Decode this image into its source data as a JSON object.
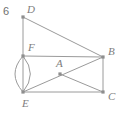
{
  "figure": {
    "number_label": "6",
    "canvas": {
      "width": 117,
      "height": 118
    },
    "stroke_color": "#9a9a9a",
    "label_color": "#7d7d7d",
    "vertex_color": "#8e8e8e",
    "background": "#ffffff",
    "points": [
      {
        "id": "D",
        "label": "D",
        "x": 23,
        "y": 17,
        "label_x": 27,
        "label_y": 13
      },
      {
        "id": "F",
        "label": "F",
        "x": 23,
        "y": 56,
        "label_x": 28,
        "label_y": 51
      },
      {
        "id": "E",
        "label": "E",
        "x": 23,
        "y": 92,
        "label_x": 22,
        "label_y": 107
      },
      {
        "id": "B",
        "label": "B",
        "x": 103,
        "y": 57,
        "label_x": 108,
        "label_y": 55
      },
      {
        "id": "C",
        "label": "C",
        "x": 103,
        "y": 92,
        "label_x": 108,
        "label_y": 100
      },
      {
        "id": "A",
        "label": "A",
        "x": 60,
        "y": 74,
        "label_x": 56,
        "label_y": 67
      }
    ],
    "segments": [
      {
        "from": "D",
        "to": "B"
      },
      {
        "from": "D",
        "to": "F"
      },
      {
        "from": "F",
        "to": "B"
      },
      {
        "from": "F",
        "to": "E"
      },
      {
        "from": "E",
        "to": "C"
      },
      {
        "from": "B",
        "to": "C"
      },
      {
        "from": "E",
        "to": "B"
      },
      {
        "from": "A",
        "to": "C"
      }
    ],
    "arcs": [
      {
        "id": "lens-left",
        "from": "F",
        "to": "E",
        "bulge_x": 11
      },
      {
        "id": "lens-right",
        "from": "F",
        "to": "E",
        "bulge_x": 34
      }
    ],
    "number_label_x": 3,
    "number_label_y": 15
  }
}
